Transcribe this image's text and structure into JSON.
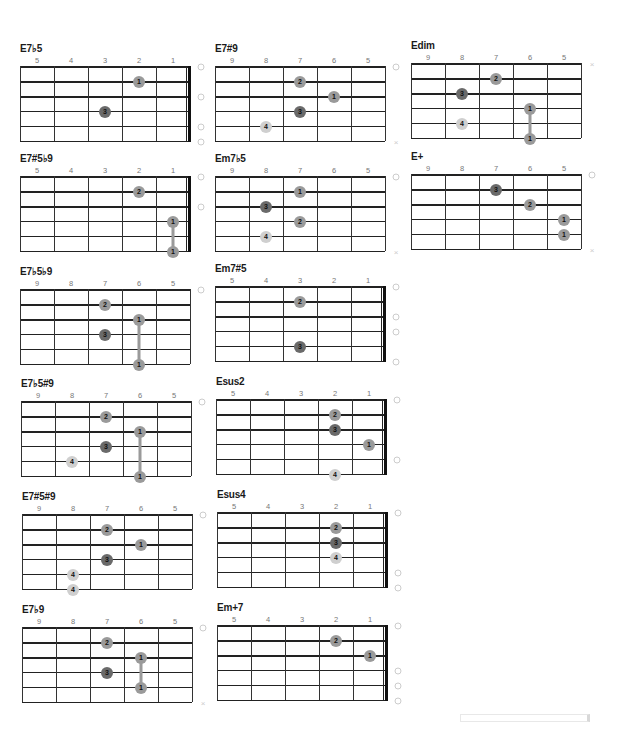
{
  "colors": {
    "finger_1_2": "#9a9a9a",
    "finger_3": "#6a6a6a",
    "finger_4": "#cfcfcf",
    "line": "#222222"
  },
  "chords": [
    {
      "id": "c0",
      "name": "E7♭5",
      "frets": [
        "5",
        "4",
        "3",
        "2",
        "1"
      ],
      "nut": true,
      "dots": [
        {
          "s": 1,
          "c": 3,
          "f": "1"
        },
        {
          "s": 3,
          "c": 2,
          "f": "3"
        }
      ],
      "marks": [
        {
          "s": 0,
          "t": "open"
        },
        {
          "s": 2,
          "t": "open"
        },
        {
          "s": 4,
          "t": "open"
        },
        {
          "s": 5,
          "t": "open"
        }
      ]
    },
    {
      "id": "c1",
      "name": "E7#9",
      "frets": [
        "9",
        "8",
        "7",
        "6",
        "5"
      ],
      "nut": false,
      "dots": [
        {
          "s": 1,
          "c": 2,
          "f": "2"
        },
        {
          "s": 2,
          "c": 3,
          "f": "1"
        },
        {
          "s": 3,
          "c": 2,
          "f": "3"
        },
        {
          "s": 4,
          "c": 1,
          "f": "4"
        }
      ],
      "marks": [
        {
          "s": 0,
          "t": "open"
        },
        {
          "s": 5,
          "t": "mute"
        }
      ]
    },
    {
      "id": "c2",
      "name": "Edim",
      "frets": [
        "9",
        "8",
        "7",
        "6",
        "5"
      ],
      "nut": false,
      "dots": [
        {
          "s": 1,
          "c": 2,
          "f": "2"
        },
        {
          "s": 2,
          "c": 1,
          "f": "3"
        },
        {
          "s": 3,
          "c": 3,
          "f": "1"
        },
        {
          "s": 4,
          "c": 1,
          "f": "4"
        },
        {
          "s": 5,
          "c": 3,
          "f": "1"
        }
      ],
      "barre": {
        "c": 3,
        "from": 3,
        "to": 5
      },
      "marks": [
        {
          "s": 0,
          "t": "mute"
        }
      ]
    },
    {
      "id": "c3",
      "name": "E7#5♭9",
      "frets": [
        "5",
        "4",
        "3",
        "2",
        "1"
      ],
      "nut": true,
      "dots": [
        {
          "s": 1,
          "c": 3,
          "f": "2"
        },
        {
          "s": 3,
          "c": 4,
          "f": "1"
        },
        {
          "s": 5,
          "c": 4,
          "f": "1"
        }
      ],
      "barre": {
        "c": 4,
        "from": 3,
        "to": 5
      },
      "marks": [
        {
          "s": 0,
          "t": "open"
        },
        {
          "s": 2,
          "t": "open"
        }
      ]
    },
    {
      "id": "c4",
      "name": "Em7♭5",
      "frets": [
        "9",
        "8",
        "7",
        "6",
        "5"
      ],
      "nut": false,
      "dots": [
        {
          "s": 1,
          "c": 2,
          "f": "1"
        },
        {
          "s": 2,
          "c": 1,
          "f": "3"
        },
        {
          "s": 3,
          "c": 2,
          "f": "2"
        },
        {
          "s": 4,
          "c": 1,
          "f": "4"
        }
      ],
      "marks": [
        {
          "s": 0,
          "t": "open"
        },
        {
          "s": 5,
          "t": "mute"
        }
      ]
    },
    {
      "id": "c5",
      "name": "E+",
      "frets": [
        "9",
        "8",
        "7",
        "6",
        "5"
      ],
      "nut": false,
      "dots": [
        {
          "s": 1,
          "c": 2,
          "f": "3"
        },
        {
          "s": 2,
          "c": 3,
          "f": "2"
        },
        {
          "s": 3,
          "c": 4,
          "f": "1"
        },
        {
          "s": 4,
          "c": 4,
          "f": "1"
        }
      ],
      "marks": [
        {
          "s": 0,
          "t": "open"
        },
        {
          "s": 5,
          "t": "mute"
        }
      ]
    },
    {
      "id": "c6",
      "name": "E7♭5♭9",
      "frets": [
        "9",
        "8",
        "7",
        "6",
        "5"
      ],
      "nut": false,
      "dots": [
        {
          "s": 1,
          "c": 2,
          "f": "2"
        },
        {
          "s": 2,
          "c": 3,
          "f": "1"
        },
        {
          "s": 3,
          "c": 2,
          "f": "3"
        },
        {
          "s": 5,
          "c": 3,
          "f": "1"
        }
      ],
      "barre": {
        "c": 3,
        "from": 2,
        "to": 5
      },
      "marks": [
        {
          "s": 0,
          "t": "open"
        }
      ]
    },
    {
      "id": "c7",
      "name": "Em7#5",
      "frets": [
        "5",
        "4",
        "3",
        "2",
        "1"
      ],
      "nut": true,
      "dots": [
        {
          "s": 1,
          "c": 2,
          "f": "2"
        },
        {
          "s": 4,
          "c": 2,
          "f": "3"
        }
      ],
      "marks": [
        {
          "s": 0,
          "t": "open"
        },
        {
          "s": 2,
          "t": "open"
        },
        {
          "s": 3,
          "t": "open"
        },
        {
          "s": 5,
          "t": "open"
        }
      ]
    },
    {
      "id": "c8",
      "name": "E7♭5#9",
      "frets": [
        "9",
        "8",
        "7",
        "6",
        "5"
      ],
      "nut": false,
      "dots": [
        {
          "s": 1,
          "c": 2,
          "f": "2"
        },
        {
          "s": 2,
          "c": 3,
          "f": "1"
        },
        {
          "s": 3,
          "c": 2,
          "f": "3"
        },
        {
          "s": 4,
          "c": 1,
          "f": "4"
        },
        {
          "s": 5,
          "c": 3,
          "f": "1"
        }
      ],
      "barre": {
        "c": 3,
        "from": 2,
        "to": 5
      },
      "marks": [
        {
          "s": 0,
          "t": "open"
        }
      ]
    },
    {
      "id": "c9",
      "name": "Esus2",
      "frets": [
        "5",
        "4",
        "3",
        "2",
        "1"
      ],
      "nut": true,
      "dots": [
        {
          "s": 1,
          "c": 3,
          "f": "2"
        },
        {
          "s": 2,
          "c": 3,
          "f": "3"
        },
        {
          "s": 3,
          "c": 4,
          "f": "1"
        },
        {
          "s": 5,
          "c": 3,
          "f": "4"
        }
      ],
      "marks": [
        {
          "s": 0,
          "t": "open"
        },
        {
          "s": 4,
          "t": "open"
        }
      ]
    },
    {
      "id": "c10",
      "name": "E7#5#9",
      "frets": [
        "9",
        "8",
        "7",
        "6",
        "5"
      ],
      "nut": false,
      "dots": [
        {
          "s": 1,
          "c": 2,
          "f": "2"
        },
        {
          "s": 2,
          "c": 3,
          "f": "1"
        },
        {
          "s": 3,
          "c": 2,
          "f": "3"
        },
        {
          "s": 4,
          "c": 1,
          "f": "4"
        },
        {
          "s": 5,
          "c": 1,
          "f": "4"
        }
      ],
      "marks": [
        {
          "s": 0,
          "t": "open"
        }
      ]
    },
    {
      "id": "c11",
      "name": "Esus4",
      "frets": [
        "5",
        "4",
        "3",
        "2",
        "1"
      ],
      "nut": true,
      "dots": [
        {
          "s": 1,
          "c": 3,
          "f": "2"
        },
        {
          "s": 2,
          "c": 3,
          "f": "3"
        },
        {
          "s": 3,
          "c": 3,
          "f": "4"
        }
      ],
      "marks": [
        {
          "s": 0,
          "t": "open"
        },
        {
          "s": 4,
          "t": "open"
        },
        {
          "s": 5,
          "t": "open"
        }
      ]
    },
    {
      "id": "c12",
      "name": "E7♭9",
      "frets": [
        "9",
        "8",
        "7",
        "6",
        "5"
      ],
      "nut": false,
      "dots": [
        {
          "s": 1,
          "c": 2,
          "f": "2"
        },
        {
          "s": 2,
          "c": 3,
          "f": "1"
        },
        {
          "s": 3,
          "c": 2,
          "f": "3"
        },
        {
          "s": 4,
          "c": 3,
          "f": "1"
        }
      ],
      "barre": {
        "c": 3,
        "from": 2,
        "to": 4
      },
      "marks": [
        {
          "s": 0,
          "t": "open"
        },
        {
          "s": 5,
          "t": "mute"
        }
      ]
    },
    {
      "id": "c13",
      "name": "Em+7",
      "frets": [
        "5",
        "4",
        "3",
        "2",
        "1"
      ],
      "nut": true,
      "dots": [
        {
          "s": 1,
          "c": 3,
          "f": "2"
        },
        {
          "s": 2,
          "c": 4,
          "f": "1"
        }
      ],
      "marks": [
        {
          "s": 0,
          "t": "open"
        },
        {
          "s": 3,
          "t": "open"
        },
        {
          "s": 4,
          "t": "open"
        },
        {
          "s": 5,
          "t": "open"
        }
      ]
    }
  ],
  "layout": [
    {
      "id": "c0",
      "x": 20,
      "y": 43
    },
    {
      "id": "c1",
      "x": 215,
      "y": 43
    },
    {
      "id": "c2",
      "x": 411,
      "y": 40
    },
    {
      "id": "c3",
      "x": 20,
      "y": 153
    },
    {
      "id": "c4",
      "x": 215,
      "y": 153
    },
    {
      "id": "c5",
      "x": 411,
      "y": 151
    },
    {
      "id": "c6",
      "x": 20,
      "y": 266
    },
    {
      "id": "c7",
      "x": 215,
      "y": 263
    },
    {
      "id": "c8",
      "x": 21,
      "y": 378
    },
    {
      "id": "c9",
      "x": 216,
      "y": 376
    },
    {
      "id": "c10",
      "x": 22,
      "y": 491
    },
    {
      "id": "c11",
      "x": 217,
      "y": 489
    },
    {
      "id": "c12",
      "x": 22,
      "y": 604
    },
    {
      "id": "c13",
      "x": 217,
      "y": 602
    }
  ]
}
